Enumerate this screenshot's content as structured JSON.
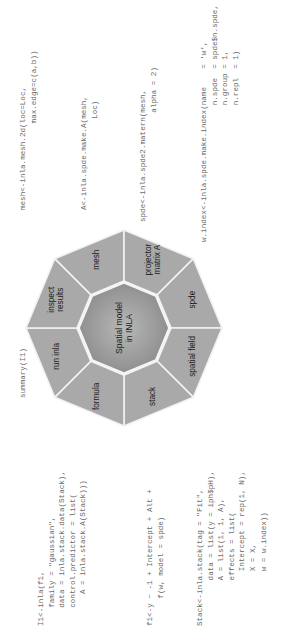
{
  "diagram": {
    "center_label": [
      "Spatial model",
      "in INLA"
    ],
    "segments": [
      {
        "id": "mesh",
        "label": [
          "mesh"
        ]
      },
      {
        "id": "projector",
        "label": [
          "projector",
          "matrix A"
        ]
      },
      {
        "id": "spde",
        "label": [
          "spde"
        ]
      },
      {
        "id": "spatial-field",
        "label": [
          "spatial field"
        ]
      },
      {
        "id": "stack",
        "label": [
          "stack"
        ]
      },
      {
        "id": "formula",
        "label": [
          "formula"
        ]
      },
      {
        "id": "run-inla",
        "label": [
          "run inla"
        ]
      },
      {
        "id": "inspect-results",
        "label": [
          "inspect",
          "results"
        ]
      }
    ],
    "colors": {
      "segment_fill": "#a9a9a9",
      "segment_border": "#f2f2f2",
      "center_fill_outer": "#8e8e8e",
      "center_fill_inner": "#b3b3b3",
      "code_text": "#6a6a6a"
    }
  },
  "code": {
    "summary": "summary(I1)",
    "mesh": "mesh<-inla.mesh.2d(loc=Loc,\n                   max.edge=c(a,b))",
    "projector": "A<-inla.spde.make.A(mesh,\n                    Loc)",
    "spde": "spde<-inla.spde2.matern(mesh,\n                        alpha = 2)",
    "index": "w.index<-inla.spde.make.index(name    = 'w',\n                              n.spde  = spde$n.spde,\n                              n.group = 1,\n                              n.repl  = 1)",
    "run_inla": "I1<-inla(f1,\n    family = \"gaussian\",\n    data = inla.stack.data(Stack),\n    control.predictor = list(\n       A = inla.stack.A(Stack)))",
    "formula": "f1<-y ~ -1 + Intercept + Alt +\n      f(w, model = spde)",
    "stack": "Stack<-inla.stack(tag = \"Fit\",\n          data = list(y = iph$pH),\n          A = list(1, 1, A),\n          effects = list(\n            Intercept = rep(1, N),\n            X = X,\n            w = w.index))"
  }
}
